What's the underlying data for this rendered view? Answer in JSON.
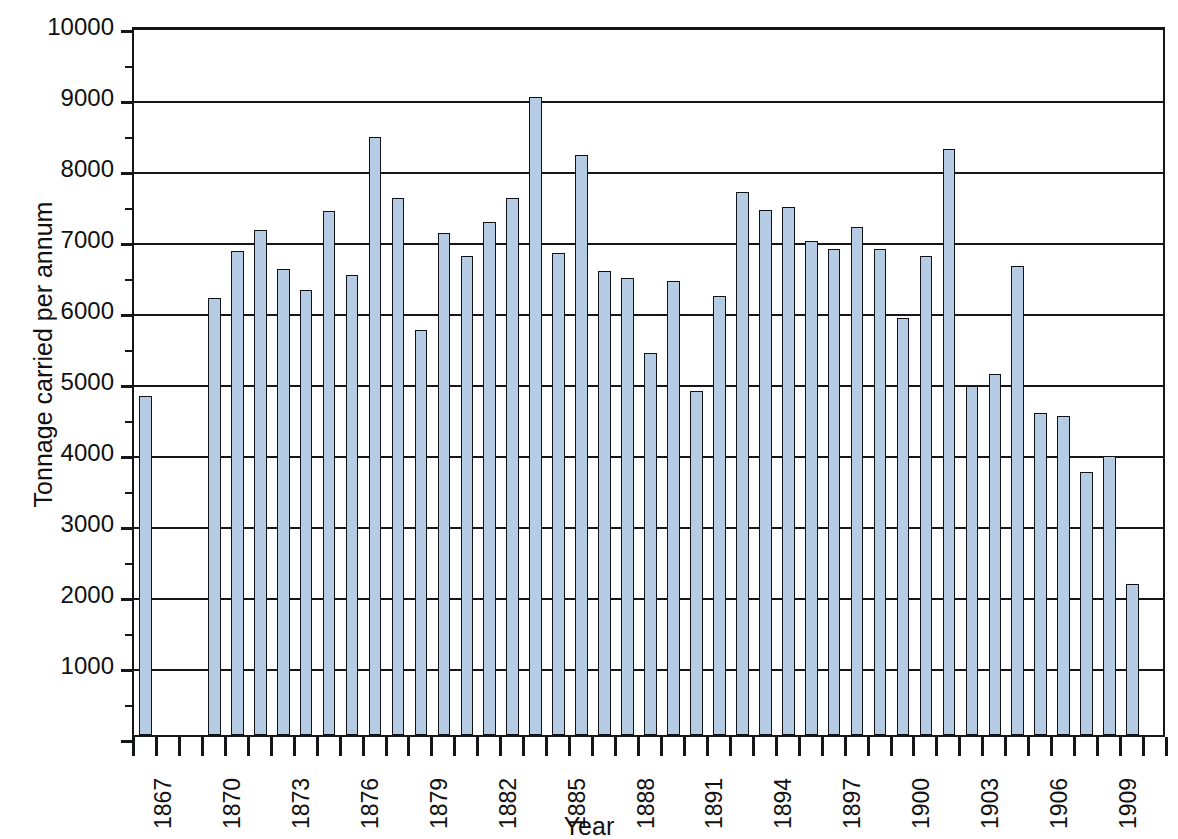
{
  "chart_data": {
    "type": "bar",
    "title": "",
    "subtitle": "",
    "xlabel": "Year",
    "ylabel": "Tonnage carried per annum",
    "ylim": [
      0,
      10000
    ],
    "xlim": [
      1866.5,
      1911.5
    ],
    "grid": true,
    "legend": null,
    "y_ticks": [
      0,
      1000,
      2000,
      3000,
      4000,
      5000,
      6000,
      7000,
      8000,
      9000,
      10000
    ],
    "y_tick_labels": [
      "",
      "1000",
      "2000",
      "3000",
      "4000",
      "5000",
      "6000",
      "7000",
      "8000",
      "9000",
      "10000"
    ],
    "x_tick_labels": [
      "1867",
      "1870",
      "1873",
      "1876",
      "1879",
      "1882",
      "1885",
      "1888",
      "1891",
      "1894",
      "1897",
      "1900",
      "1903",
      "1906",
      "1909"
    ],
    "x_tick_label_interval": 3,
    "bar_color": "#b6cbe4",
    "bar_edge_color": "#111217",
    "axis_color": "#15161a",
    "background_color": "#ffffff",
    "categories": [
      "1867",
      "1868",
      "1869",
      "1870",
      "1871",
      "1872",
      "1873",
      "1874",
      "1875",
      "1876",
      "1877",
      "1878",
      "1879",
      "1880",
      "1881",
      "1882",
      "1883",
      "1884",
      "1885",
      "1886",
      "1887",
      "1888",
      "1889",
      "1890",
      "1891",
      "1892",
      "1893",
      "1894",
      "1895",
      "1896",
      "1897",
      "1898",
      "1899",
      "1900",
      "1901",
      "1902",
      "1903",
      "1904",
      "1905",
      "1906",
      "1907",
      "1908",
      "1909",
      "1910",
      "1911"
    ],
    "values": [
      4780,
      null,
      null,
      6160,
      6820,
      7110,
      6570,
      6270,
      7380,
      6480,
      8420,
      7560,
      5700,
      7070,
      6740,
      7220,
      7560,
      8980,
      6790,
      8170,
      6540,
      6440,
      5380,
      6400,
      4840,
      6180,
      7650,
      7400,
      7440,
      6960,
      6850,
      7160,
      6840,
      5880,
      6740,
      8260,
      4920,
      5090,
      6610,
      4530,
      4490,
      3710,
      3930,
      2120,
      null
    ],
    "notes": {
      "missing_years": [
        "1868",
        "1869"
      ],
      "max_value": 8980,
      "max_year": "1884",
      "min_value": 2120,
      "min_year": "1910"
    }
  }
}
